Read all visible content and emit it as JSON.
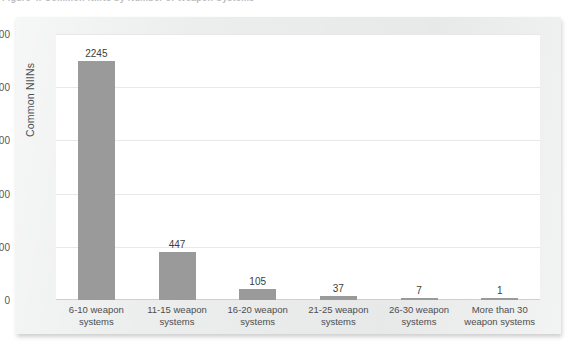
{
  "caption": {
    "text": "Figure 4: Common NIINs by Number of Weapon Systems"
  },
  "chart_data": {
    "type": "bar",
    "title": "",
    "xlabel": "",
    "ylabel": "Common NIINs",
    "categories": [
      "6-10 weapon systems",
      "11-15 weapon systems",
      "16-20 weapon systems",
      "21-25 weapon systems",
      "26-30 weapon systems",
      "More than 30 weapon systems"
    ],
    "values": [
      2245,
      447,
      105,
      37,
      7,
      1
    ],
    "value_labels": [
      "2245",
      "447",
      "105",
      "37",
      "7",
      "1"
    ],
    "ylim": [
      0,
      2500
    ],
    "yticks": [
      0,
      500,
      1000,
      1500,
      2000,
      2500
    ],
    "ytick_labels": [
      "0",
      "500",
      "1,000",
      "1,500",
      "2,000",
      "2,500"
    ],
    "grid": true,
    "legend": false,
    "bar_color": "#9a9a9a",
    "plot_background": "#ffffff",
    "card_background": "#eceded",
    "gridline_color": "#e8e8e8",
    "text_color": "#4c4e50"
  }
}
